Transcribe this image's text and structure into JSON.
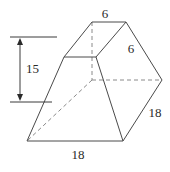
{
  "figure": {
    "type": "frustum-prism",
    "labels": {
      "top_front_edge": "6",
      "top_side_edge": "6",
      "bottom_front_edge": "18",
      "bottom_side_edge": "18",
      "height": "15"
    },
    "colors": {
      "edge": "#4a4a4a",
      "hidden_edge": "#8a8a8a",
      "text": "#2a2a2a"
    }
  }
}
